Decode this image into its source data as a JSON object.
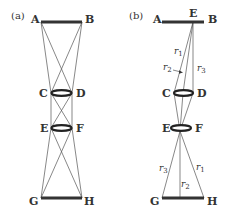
{
  "figure": {
    "panels": [
      {
        "id": "a",
        "label": "(a)",
        "points": {
          "A": "A",
          "B": "B",
          "C": "C",
          "D": "D",
          "E": "E",
          "F": "F",
          "G": "G",
          "H": "H"
        }
      },
      {
        "id": "b",
        "label": "(b)",
        "points": {
          "A": "A",
          "E_top": "E",
          "B": "B",
          "C": "C",
          "D": "D",
          "E": "E",
          "F": "F",
          "G": "G",
          "H": "H"
        },
        "rays_top": [
          {
            "name": "r",
            "sub": "1"
          },
          {
            "name": "r",
            "sub": "2"
          },
          {
            "name": "r",
            "sub": "3"
          }
        ],
        "rays_bottom": [
          {
            "name": "r",
            "sub": "3"
          },
          {
            "name": "r",
            "sub": "2"
          },
          {
            "name": "r",
            "sub": "1"
          }
        ]
      }
    ]
  }
}
